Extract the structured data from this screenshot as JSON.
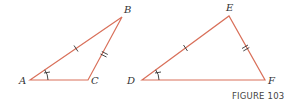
{
  "figure": {
    "caption": "FIGURE 103",
    "stroke_color": "#d9705a",
    "mark_color": "#333333",
    "triangles": [
      {
        "name": "ABC",
        "vertices": {
          "A": {
            "label": "A",
            "x": 30,
            "y": 80,
            "lx": 19,
            "ly": 84
          },
          "B": {
            "label": "B",
            "x": 122,
            "y": 17,
            "lx": 124,
            "ly": 13
          },
          "C": {
            "label": "C",
            "x": 88,
            "y": 80,
            "lx": 91,
            "ly": 84
          }
        },
        "marks": {
          "AB": "single-tick",
          "BC": "double-tick",
          "angle_A": "single-arc-tick"
        }
      },
      {
        "name": "DEF",
        "vertices": {
          "D": {
            "label": "D",
            "x": 142,
            "y": 80,
            "lx": 124,
            "ly": 84
          },
          "E": {
            "label": "E",
            "x": 229,
            "y": 16,
            "lx": 226,
            "ly": 11
          },
          "F": {
            "label": "F",
            "x": 265,
            "y": 80,
            "lx": 268,
            "ly": 84
          }
        },
        "marks": {
          "DE": "single-tick",
          "EF": "double-tick",
          "angle_D": "single-arc-tick"
        }
      }
    ]
  }
}
